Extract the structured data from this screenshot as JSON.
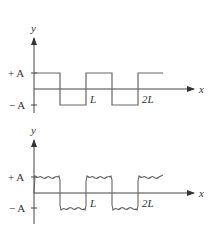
{
  "figures": [
    {
      "id": "square-wave",
      "y_axis_label": "y",
      "x_axis_label": "x",
      "plus_label": "+ A",
      "minus_label": "− A",
      "tick_L": "L",
      "tick_2L": "2L"
    },
    {
      "id": "fourier-approximation",
      "y_axis_label": "y",
      "x_axis_label": "x",
      "plus_label": "+ A",
      "minus_label": "− A",
      "tick_L": "L",
      "tick_2L": "2L"
    }
  ],
  "colors": {
    "line": "#666666",
    "axis": "#444444",
    "text": "#333333"
  }
}
